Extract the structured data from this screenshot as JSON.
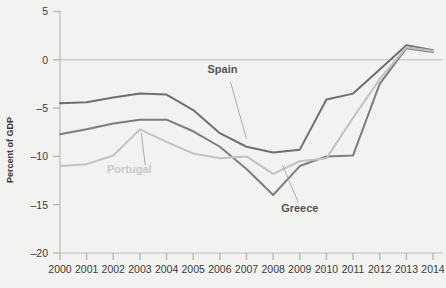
{
  "chart_data": {
    "type": "line",
    "title": "",
    "xlabel": "",
    "ylabel": "Percent of GDP",
    "x": [
      2000,
      2001,
      2002,
      2003,
      2004,
      2005,
      2006,
      2007,
      2008,
      2009,
      2010,
      2011,
      2012,
      2013,
      2014
    ],
    "xlim": [
      2000,
      2014
    ],
    "ylim": [
      -20,
      5
    ],
    "yticks": [
      5,
      0,
      -5,
      -10,
      -15,
      -20
    ],
    "ytick_labels": [
      "5",
      "0",
      "–5",
      "–10",
      "–15",
      "–20"
    ],
    "xtick_labels": [
      "2000",
      "2001",
      "2002",
      "2003",
      "2004",
      "2005",
      "2006",
      "2007",
      "2008",
      "2009",
      "2010",
      "2011",
      "2012",
      "2013",
      "2014"
    ],
    "grid": false,
    "zero_line": true,
    "legend": "inline-labels",
    "series": [
      {
        "name": "Spain",
        "color": "#6f6f6f",
        "label_x": 2006.1,
        "label_y": -1.4,
        "values": [
          -4.5,
          -4.4,
          -3.9,
          -3.5,
          -3.6,
          -5.2,
          -7.6,
          -9.0,
          -9.6,
          -9.3,
          -4.1,
          -3.5,
          -1.0,
          1.5,
          1.0
        ]
      },
      {
        "name": "Greece",
        "color": "#7d7d7d",
        "label_x": 2009.0,
        "label_y": -15.8,
        "values": [
          -7.7,
          -7.2,
          -6.6,
          -6.2,
          -6.2,
          -7.4,
          -9.0,
          -11.3,
          -14.0,
          -11.0,
          -10.0,
          -9.9,
          -2.5,
          1.2,
          0.8
        ]
      },
      {
        "name": "Portugal",
        "color": "#c2c2c2",
        "label_x": 2002.6,
        "label_y": -11.7,
        "values": [
          -11.0,
          -10.8,
          -9.9,
          -7.2,
          -8.5,
          -9.7,
          -10.2,
          -10.0,
          -11.8,
          -10.5,
          -10.2,
          -6.0,
          -2.0,
          1.3,
          0.9
        ]
      }
    ],
    "annotations": [
      {
        "text": "Spain",
        "leader_from_x": 2006.4,
        "leader_from_y": -2.3,
        "leader_to_x": 2007.0,
        "leader_to_y": -8.2
      },
      {
        "text": "Greece",
        "leader_from_x": 2008.95,
        "leader_from_y": -14.8,
        "leader_to_x": 2008.35,
        "leader_to_y": -10.9
      },
      {
        "text": "Portugal",
        "leader_from_x": 2003.2,
        "leader_from_y": -10.9,
        "leader_to_x": 2003.05,
        "leader_to_y": -7.6
      }
    ]
  },
  "colors": {
    "background": "#f2f2f0",
    "axis": "#b9b9b9",
    "text": "#3a3a3a",
    "spain": "#6f6f6f",
    "greece": "#7d7d7d",
    "portugal": "#c2c2c2"
  }
}
